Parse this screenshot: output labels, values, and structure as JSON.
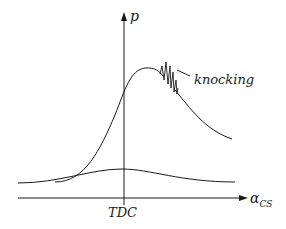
{
  "diagram": {
    "y_axis_label": "p",
    "x_axis_label": "α",
    "x_axis_subscript": "CS",
    "tick_label": "TDC",
    "annotation": "knocking",
    "curves": [
      {
        "name": "combustion-pressure-curve",
        "description": "Pressure with combustion, peak after TDC, knocking oscillation on falling side"
      },
      {
        "name": "motored-pressure-curve",
        "description": "Pressure without combustion, small peak at TDC"
      }
    ],
    "colors": {
      "line": "#1a1a1a",
      "background": "#ffffff"
    }
  }
}
